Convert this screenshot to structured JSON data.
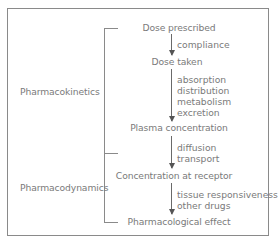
{
  "diagram": {
    "nodes": [
      {
        "id": "dose-prescribed",
        "label": "Dose prescribed"
      },
      {
        "id": "dose-taken",
        "label": "Dose taken"
      },
      {
        "id": "plasma-concentration",
        "label": "Plasma concentration"
      },
      {
        "id": "concentration-at-receptor",
        "label": "Concentration at receptor"
      },
      {
        "id": "pharmacological-effect",
        "label": "Pharmacological effect"
      }
    ],
    "edges": [
      {
        "from": "dose-prescribed",
        "to": "dose-taken",
        "labels": [
          "compliance"
        ]
      },
      {
        "from": "dose-taken",
        "to": "plasma-concentration",
        "labels": [
          "absorption",
          "distribution",
          "metabolism",
          "excretion"
        ]
      },
      {
        "from": "plasma-concentration",
        "to": "concentration-at-receptor",
        "labels": [
          "diffusion",
          "transport"
        ]
      },
      {
        "from": "concentration-at-receptor",
        "to": "pharmacological-effect",
        "labels": [
          "tissue responsiveness",
          "other drugs"
        ]
      }
    ],
    "groups": [
      {
        "id": "pharmacokinetics",
        "label": "Pharmacokinetics",
        "spans": [
          "dose-prescribed",
          "plasma-concentration"
        ]
      },
      {
        "id": "pharmacodynamics",
        "label": "Pharmacodynamics",
        "spans": [
          "plasma-concentration",
          "pharmacological-effect"
        ]
      }
    ],
    "colors": {
      "text": "#7a7a7a",
      "lines": "#8a8a8a",
      "arrows": "#555555"
    }
  }
}
